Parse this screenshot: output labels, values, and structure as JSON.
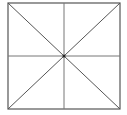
{
  "diagram": {
    "type": "square-with-diagonals-and-midlines",
    "stroke_color": "#555555",
    "background": "#ffffff",
    "square": {
      "x1": 8,
      "y1": 3,
      "x2": 120,
      "y2": 109
    },
    "center": {
      "x": 63,
      "y": 56
    }
  }
}
